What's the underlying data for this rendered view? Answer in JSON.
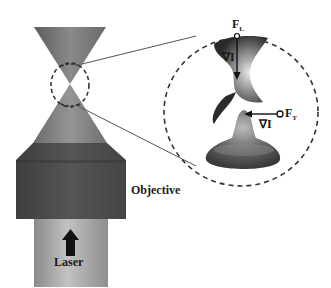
{
  "diagram": {
    "labels": {
      "objective": "Objective",
      "laser": "Laser",
      "force_longitudinal": "F",
      "force_longitudinal_sub": "L",
      "force_transverse": "F",
      "force_transverse_sub": "T",
      "gradient_1": "∇I",
      "gradient_2": "∇I"
    },
    "components": [
      {
        "name": "converging-beam-cone",
        "color": "#6e6e6e"
      },
      {
        "name": "diverging-beam-cone",
        "color": "#7a7a7a"
      },
      {
        "name": "focus-region-circle",
        "style": "dashed"
      },
      {
        "name": "magnified-inset-circle",
        "style": "dashed"
      },
      {
        "name": "intensity-surface-saddle",
        "color": "#555555"
      },
      {
        "name": "intensity-peak-profile",
        "color": "#6a6a6a"
      },
      {
        "name": "objective-lens-body",
        "color": "#4a4a4a"
      },
      {
        "name": "laser-tube",
        "color": "#9a9a9a"
      }
    ],
    "colors": {
      "background": "#ffffff",
      "text": "#1a1a1a",
      "objective": "#4a4a4a",
      "laser_tube": "#a0a0a0",
      "cone": "#777777"
    }
  }
}
